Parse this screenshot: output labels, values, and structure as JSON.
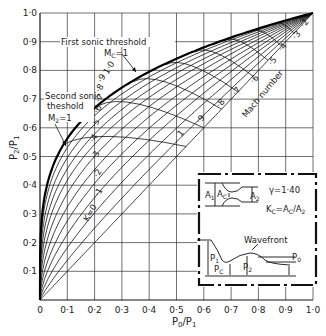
{
  "chart_data": {
    "type": "line",
    "title": "",
    "xlabel": "P0/P1",
    "ylabel": "P2/P1",
    "xlim": [
      0,
      1.0
    ],
    "ylim": [
      0,
      1.0
    ],
    "grid": true,
    "x_ticks": [
      "0",
      "0·1",
      "0·2",
      "0·3",
      "0·4",
      "0·5",
      "0·6",
      "0·7",
      "0·8",
      "0·9",
      "1·0"
    ],
    "y_ticks": [
      "0·1",
      "0·2",
      "0·3",
      "0·4",
      "0·5",
      "0·6",
      "0·7",
      "0·8",
      "0·9",
      "1·0"
    ],
    "k_curves": {
      "parameter": "K",
      "labels": [
        "K=0",
        "·1",
        "·2",
        "·3",
        "·4",
        "·5",
        "·6",
        "·7",
        "·8",
        "·9",
        "1·0"
      ],
      "values": [
        0,
        0.1,
        0.2,
        0.3,
        0.4,
        0.5,
        0.6,
        0.7,
        0.8,
        0.9,
        1.0
      ],
      "exponent_approx": [
        1.0,
        0.86,
        0.74,
        0.64,
        0.56,
        0.49,
        0.43,
        0.38,
        0.34,
        0.305,
        0.275
      ]
    },
    "envelope": {
      "label": "Second sonic theshold M2=1",
      "exponent_approx": 0.25
    },
    "mach_curves": {
      "label": "Mach number",
      "labels": [
        "1",
        "·9",
        "·8",
        "·7",
        "·6",
        "·5",
        "·4",
        "·3",
        "·2"
      ],
      "values": [
        1.0,
        0.9,
        0.8,
        0.7,
        0.6,
        0.5,
        0.4,
        0.3,
        0.2
      ],
      "diagonal_start_x": [
        0.535,
        0.6,
        0.665,
        0.725,
        0.78,
        0.835,
        0.885,
        0.93,
        0.97
      ]
    },
    "annotations": [
      {
        "text": "First sonic threshold",
        "sub": "MC=1"
      },
      {
        "text": "Second sonic",
        "line2": "theshold",
        "line3": "M2=1"
      }
    ],
    "inset": {
      "gamma": "γ=1·40",
      "kc_def": "KC=AC/A2",
      "labels": [
        "A1",
        "AC",
        "A2",
        "P1",
        "PC",
        "P2",
        "P0",
        "Wavefront"
      ]
    }
  }
}
